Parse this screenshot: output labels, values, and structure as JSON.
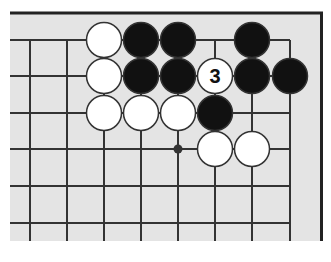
{
  "diagram": {
    "type": "go-board-fragment",
    "colors": {
      "board": "#e4e4e4",
      "line": "#333333",
      "black_stone": "#111111",
      "white_stone": "#ffffff",
      "stone_outline": "#333333",
      "label": "#111111"
    },
    "grid": {
      "columns_x": [
        30,
        67,
        104,
        141,
        178,
        215,
        252,
        290
      ],
      "rows_y": [
        40,
        76,
        113,
        149,
        186,
        223
      ]
    },
    "star_points": [
      {
        "col": 4,
        "row": 3
      }
    ],
    "stones": [
      {
        "color": "white",
        "col": 2,
        "row": 0
      },
      {
        "color": "black",
        "col": 3,
        "row": 0
      },
      {
        "color": "black",
        "col": 4,
        "row": 0
      },
      {
        "color": "black",
        "col": 6,
        "row": 0
      },
      {
        "color": "white",
        "col": 2,
        "row": 1
      },
      {
        "color": "black",
        "col": 3,
        "row": 1
      },
      {
        "color": "black",
        "col": 4,
        "row": 1
      },
      {
        "color": "white",
        "col": 5,
        "row": 1,
        "label": "3"
      },
      {
        "color": "black",
        "col": 6,
        "row": 1
      },
      {
        "color": "black",
        "col": 7,
        "row": 1
      },
      {
        "color": "white",
        "col": 2,
        "row": 2
      },
      {
        "color": "white",
        "col": 3,
        "row": 2
      },
      {
        "color": "white",
        "col": 4,
        "row": 2
      },
      {
        "color": "black",
        "col": 5,
        "row": 2
      },
      {
        "color": "white",
        "col": 5,
        "row": 3
      },
      {
        "color": "white",
        "col": 6,
        "row": 3
      }
    ],
    "move_label": "3"
  }
}
